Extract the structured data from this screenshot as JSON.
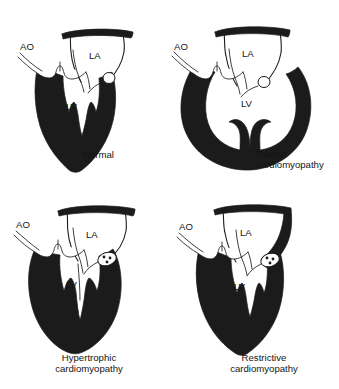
{
  "figure": {
    "title_cut_off": "",
    "background_color": "#ffffff",
    "ink_color": "#1b1b1b",
    "width": 339,
    "height": 389
  },
  "labels": {
    "aorta": "AO",
    "left_atrium": "LA",
    "left_ventricle": "LV"
  },
  "panels": [
    {
      "id": "normal",
      "caption": "Normal",
      "caption_lines": [
        "Normal"
      ],
      "ao": "AO",
      "la": "LA",
      "lv": "LV",
      "has_annulus_detail": false,
      "cavity": "v-shaped-normal"
    },
    {
      "id": "dilated",
      "caption": "Dilated cardiomyopathy",
      "caption_lines": [
        "Dilated",
        "cardiomyopathy"
      ],
      "ao": "AO",
      "la": "LA",
      "lv": "LV",
      "has_annulus_detail": false,
      "cavity": "rounded-dilated"
    },
    {
      "id": "hypertrophic",
      "caption": "Hypertrophic cardiomyopathy",
      "caption_lines": [
        "Hypertrophic",
        "cardiomyopathy"
      ],
      "ao": "AO",
      "la": "LA",
      "lv": "LV",
      "has_annulus_detail": true,
      "cavity": "narrow-slit"
    },
    {
      "id": "restrictive",
      "caption": "Restrictive cardiomyopathy",
      "caption_lines": [
        "Restrictive",
        "cardiomyopathy"
      ],
      "ao": "AO",
      "la": "LA",
      "lv": "LV",
      "has_annulus_detail": true,
      "cavity": "v-shaped-normal"
    }
  ]
}
